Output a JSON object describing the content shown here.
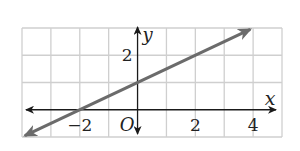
{
  "chart_data": {
    "type": "line",
    "title": "",
    "xlabel": "x",
    "ylabel": "y",
    "xlim": [
      -4,
      5
    ],
    "ylim": [
      -1,
      3
    ],
    "grid": true,
    "origin_label": "O",
    "x_tick_labels": [
      {
        "value": -2,
        "label": "−2"
      },
      {
        "value": 2,
        "label": "2"
      },
      {
        "value": 4,
        "label": "4"
      }
    ],
    "y_tick_labels": [
      {
        "value": 2,
        "label": "2"
      }
    ],
    "series": [
      {
        "name": "line",
        "equation": "y = 0.5x + 1",
        "slope": 0.5,
        "intercept": 1,
        "x": [
          -4,
          -2,
          0,
          2,
          4
        ],
        "y": [
          -1,
          0,
          1,
          2,
          3
        ],
        "arrows_both_ends": true,
        "color": "#6b6b6b"
      }
    ]
  },
  "colors": {
    "grid": "#cfcfcf",
    "axis": "#1a1a1a",
    "line": "#6b6b6b"
  }
}
